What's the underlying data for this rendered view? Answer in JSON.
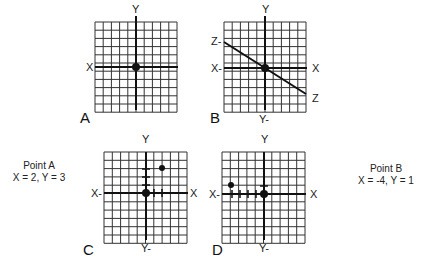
{
  "panels": [
    {
      "id": "A",
      "letter": "A",
      "axis_labels": {
        "y_top": "Y",
        "x_left": "X"
      },
      "grid": {
        "left": 95,
        "top": 22,
        "cols": 10,
        "rows": 11,
        "cell": 8.2,
        "origin_col": 5,
        "origin_row": 5.5
      }
    },
    {
      "id": "B",
      "letter": "B",
      "axis_labels": {
        "y_top": "Y",
        "y_bottom": "Y-",
        "x_left": "X-",
        "x_right": "X",
        "z_left": "Z-",
        "z_right": "Z"
      },
      "grid": {
        "left": 224,
        "top": 22,
        "cols": 10,
        "rows": 11,
        "cell": 8.2,
        "origin_col": 5,
        "origin_row": 5.5
      }
    },
    {
      "id": "C",
      "letter": "C",
      "axis_labels": {
        "y_top": "Y",
        "y_bottom": "Y-",
        "x_left": "X-",
        "x_right": "X"
      },
      "grid": {
        "left": 104,
        "top": 152,
        "cols": 10,
        "rows": 11,
        "cell": 8.3,
        "origin_col": 5,
        "origin_row": 5
      },
      "plotted_point": {
        "x": 2,
        "y": 3
      }
    },
    {
      "id": "D",
      "letter": "D",
      "axis_labels": {
        "y_top": "Y",
        "y_bottom": "Y-",
        "x_left": "X-",
        "x_right": "X"
      },
      "grid": {
        "left": 222,
        "top": 152,
        "cols": 10,
        "rows": 11,
        "cell": 8.3,
        "origin_col": 5,
        "origin_row": 5
      },
      "plotted_point": {
        "x": -4,
        "y": 1
      }
    }
  ],
  "point_a": {
    "title": "Point A",
    "coords": "X = 2, Y = 3"
  },
  "point_b": {
    "title": "Point B",
    "coords": "X = -4, Y = 1"
  },
  "colors": {
    "grid_line": "#333333",
    "axis_line": "#111111",
    "background": "#ffffff"
  }
}
